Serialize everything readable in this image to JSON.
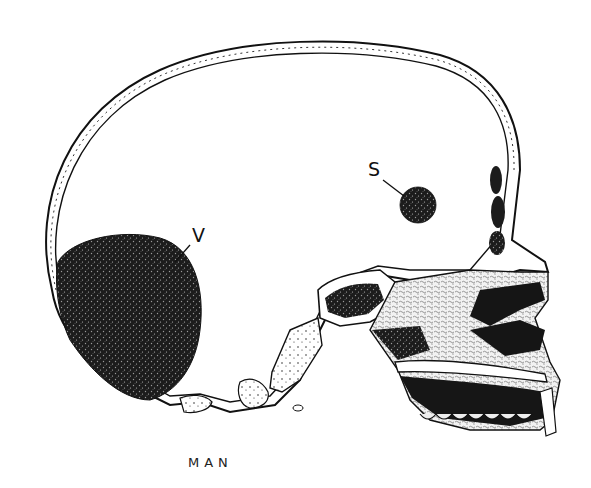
{
  "figure": {
    "caption": "MAN",
    "labels": [
      {
        "id": "V",
        "text": "V"
      },
      {
        "id": "S",
        "text": "S"
      }
    ],
    "colors": {
      "ink": "#111111",
      "background": "#ffffff",
      "stipple_light": "#d8d8d8",
      "stipple_dark": "#1e1e1e"
    }
  }
}
